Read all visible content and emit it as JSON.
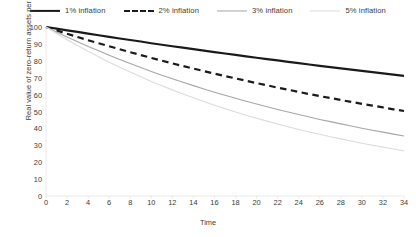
{
  "chart_data": {
    "type": "line",
    "title": "",
    "xlabel": "Time",
    "ylabel": "Real value of zero-return assets per cent",
    "xlim": [
      0,
      34
    ],
    "ylim": [
      0,
      100
    ],
    "grid": false,
    "legend_position": "top-center",
    "x": [
      0,
      1,
      2,
      3,
      4,
      5,
      6,
      7,
      8,
      9,
      10,
      11,
      12,
      13,
      14,
      15,
      16,
      17,
      18,
      19,
      20,
      21,
      22,
      23,
      24,
      25,
      26,
      27,
      28,
      29,
      30,
      31,
      32,
      33,
      34
    ],
    "xticks": [
      0,
      2,
      4,
      6,
      8,
      10,
      12,
      14,
      16,
      18,
      20,
      22,
      24,
      26,
      28,
      30,
      32,
      34
    ],
    "yticks": [
      0,
      10,
      20,
      30,
      40,
      50,
      60,
      70,
      80,
      90,
      100
    ],
    "series": [
      {
        "name": "1% inflation",
        "color": "#1a1a1a",
        "style": "solid",
        "width": 2.2,
        "values": [
          100,
          99,
          98,
          97.1,
          96.1,
          95.1,
          94.2,
          93.2,
          92.3,
          91.4,
          90.4,
          89.5,
          88.6,
          87.8,
          86.9,
          86,
          85.1,
          84.3,
          83.5,
          82.6,
          81.8,
          81,
          80.2,
          79.4,
          78.6,
          77.8,
          77,
          76.3,
          75.5,
          74.8,
          74,
          73.3,
          72.6,
          71.8,
          71.1
        ]
      },
      {
        "name": "2% inflation",
        "color": "#1a1a1a",
        "style": "dashed",
        "width": 2.2,
        "values": [
          100,
          98,
          96,
          94.1,
          92.2,
          90.4,
          88.6,
          86.8,
          85.1,
          83.4,
          81.7,
          80.1,
          78.5,
          76.9,
          75.4,
          73.9,
          72.4,
          71,
          69.6,
          68.2,
          66.8,
          65.5,
          64.1,
          62.9,
          61.6,
          60.3,
          59.1,
          58,
          56.8,
          55.7,
          54.5,
          53.5,
          52.4,
          51.3,
          50.3
        ]
      },
      {
        "name": "3% inflation",
        "color": "#a6a6a6",
        "style": "solid",
        "width": 1.1,
        "values": [
          100,
          97,
          94.1,
          91.3,
          88.5,
          85.9,
          83.3,
          80.8,
          78.4,
          76,
          73.7,
          71.5,
          69.4,
          67.3,
          65.3,
          63.3,
          61.4,
          59.6,
          57.8,
          56.1,
          54.4,
          52.8,
          51.2,
          49.7,
          48.2,
          46.7,
          45.3,
          44,
          42.7,
          41.4,
          40.1,
          38.9,
          37.8,
          36.6,
          35.5
        ]
      },
      {
        "name": "5% inflation",
        "color": "#dcdcdc",
        "style": "solid",
        "width": 1.1,
        "values": [
          100,
          96.2,
          92.5,
          89,
          85.6,
          82.4,
          79.2,
          76.2,
          73.3,
          70.5,
          67.8,
          65.3,
          62.8,
          60.4,
          58.1,
          55.9,
          53.7,
          51.7,
          49.7,
          47.8,
          46,
          44.3,
          42.6,
          41,
          39.4,
          37.9,
          36.5,
          35.1,
          33.8,
          32.5,
          31.2,
          30,
          28.9,
          27.8,
          26.7
        ]
      }
    ]
  },
  "legend": {
    "entries": [
      {
        "label": "1% inflation"
      },
      {
        "label": "2% inflation"
      },
      {
        "label": "3% inflation"
      },
      {
        "label": "5% inflation"
      }
    ]
  },
  "axes": {
    "x_title": "Time",
    "y_title": "Real value of zero-return assets per cent"
  }
}
